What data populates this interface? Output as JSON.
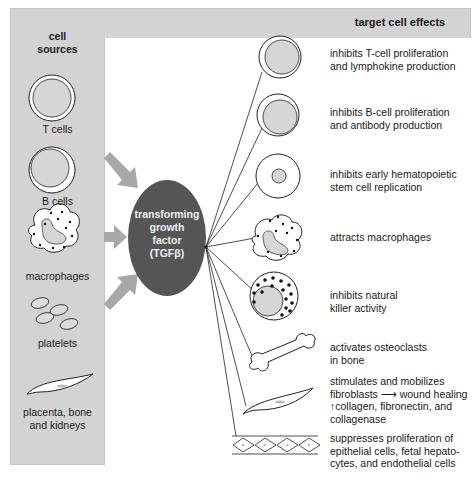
{
  "left_panel": {
    "title_line1": "cell",
    "title_line2": "sources",
    "sources": [
      {
        "label": "T cells",
        "icon": "t-cell"
      },
      {
        "label": "B cells",
        "icon": "b-cell"
      },
      {
        "label": "macrophages",
        "icon": "macrophage"
      },
      {
        "label": "platelets",
        "icon": "platelets"
      },
      {
        "label_line1": "placenta, bone",
        "label_line2": "and kidneys",
        "icon": "fibroblast-cell"
      }
    ]
  },
  "hub": {
    "line1": "transforming",
    "line2": "growth",
    "line3": "factor",
    "line4": "(TGFβ)",
    "color": "#555555"
  },
  "right_panel": {
    "title": "target cell effects",
    "effects": [
      {
        "icon": "t-cell",
        "line1": "inhibits T-cell proliferation",
        "line2": "and lymphokine production"
      },
      {
        "icon": "b-cell",
        "line1": "inhibits B-cell proliferation",
        "line2": "and antibody production"
      },
      {
        "icon": "stem-cell",
        "line1": "inhibits early hematopoietic",
        "line2": "stem cell replication"
      },
      {
        "icon": "macrophage",
        "line1": "attracts macrophages"
      },
      {
        "icon": "natural-killer-cell",
        "line1": "inhibits natural",
        "line2": "killer activity"
      },
      {
        "icon": "bone",
        "line1": "activates osteoclasts",
        "line2": "in bone"
      },
      {
        "icon": "fibroblast",
        "line1": "stimulates and mobilizes",
        "line2": "fibroblasts ⟶ wound healing",
        "line3": "↑collagen, fibronectin, and",
        "line4": "collagenase"
      },
      {
        "icon": "epithelial-cells",
        "line1": "suppresses proliferation of",
        "line2": "epithelial cells, fetal hepato-",
        "line3": "cytes, and endothelial cells"
      }
    ]
  },
  "colors": {
    "panel_gray": "#d3d3d3",
    "arrow_gray": "#a8a8a8",
    "cell_fill": "#d6d6d6",
    "hub_fill": "#555555"
  }
}
